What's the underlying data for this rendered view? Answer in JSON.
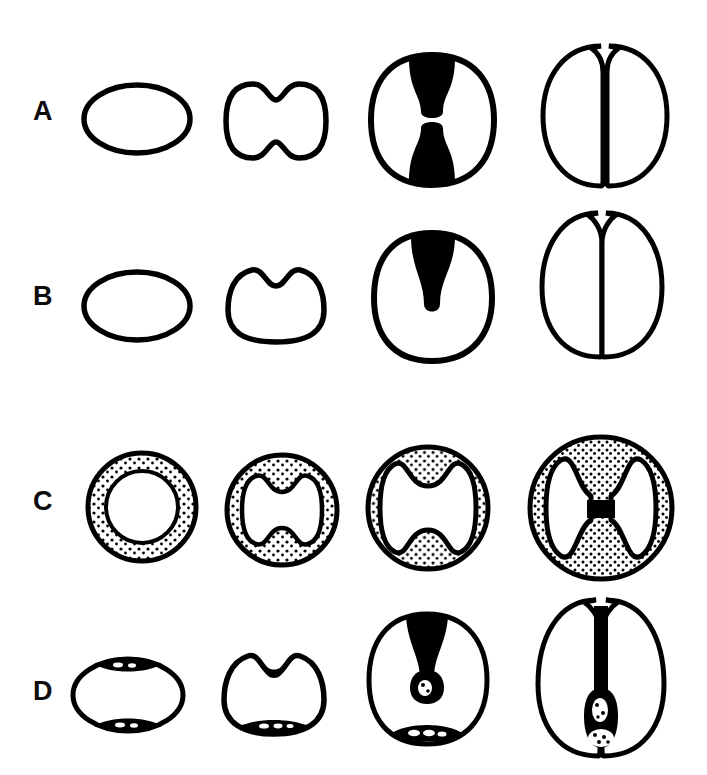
{
  "figure": {
    "background_color": "#ffffff",
    "ink_color": "#000000",
    "rows": 4,
    "columns": 4,
    "row_labels": [
      "A",
      "B",
      "C",
      "D"
    ]
  },
  "rows": [
    {
      "label": "A",
      "name": "row-a-bilateral-furrow",
      "description": "Bilateral cleavage furrow ingressing from both poles",
      "stages": [
        {
          "name": "a-stage-1",
          "stage_label": "1",
          "shape": "ellipse-uncleaved"
        },
        {
          "name": "a-stage-2",
          "stage_label": "2",
          "shape": "bilateral-shallow-furrow"
        },
        {
          "name": "a-stage-3",
          "stage_label": "3",
          "shape": "bilateral-deep-furrow-filled"
        },
        {
          "name": "a-stage-4",
          "stage_label": "4",
          "shape": "completed-bilateral-cleavage"
        }
      ]
    },
    {
      "label": "B",
      "name": "row-b-unilateral-furrow",
      "description": "Unilateral cleavage furrow ingressing from one pole only",
      "stages": [
        {
          "name": "b-stage-1",
          "stage_label": "1",
          "shape": "ellipse-uncleaved"
        },
        {
          "name": "b-stage-2",
          "stage_label": "2",
          "shape": "unilateral-shallow-furrow"
        },
        {
          "name": "b-stage-3",
          "stage_label": "3",
          "shape": "unilateral-deep-furrow-filled"
        },
        {
          "name": "b-stage-4",
          "stage_label": "4",
          "shape": "completed-unilateral-cleavage"
        }
      ]
    },
    {
      "label": "C",
      "name": "row-c-stippled-cortex",
      "description": "Stippled cortex thickening with inner cavity constricting into two lobes",
      "stages": [
        {
          "name": "c-stage-1",
          "stage_label": "1",
          "shape": "annulus-open-cavity"
        },
        {
          "name": "c-stage-2",
          "stage_label": "2",
          "shape": "cavity-waisted"
        },
        {
          "name": "c-stage-3",
          "stage_label": "3",
          "shape": "cavity-constricted"
        },
        {
          "name": "c-stage-4",
          "stage_label": "4",
          "shape": "cavity-dumbbell-separated"
        }
      ]
    },
    {
      "label": "D",
      "name": "row-d-polar-caps",
      "description": "Dark polar caps with speckles; furrow descends to meet basal mass",
      "stages": [
        {
          "name": "d-stage-1",
          "stage_label": "1",
          "shape": "ellipse-two-polar-caps"
        },
        {
          "name": "d-stage-2",
          "stage_label": "2",
          "shape": "apical-notch-basal-cap"
        },
        {
          "name": "d-stage-3",
          "stage_label": "3",
          "shape": "furrow-with-vesicle"
        },
        {
          "name": "d-stage-4",
          "stage_label": "4",
          "shape": "furrow-meets-basal-mass"
        }
      ]
    }
  ]
}
